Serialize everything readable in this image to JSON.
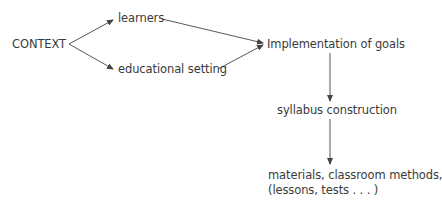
{
  "diagram": {
    "nodes": {
      "context": "CONTEXT",
      "learners": "learners",
      "educational_setting": "educational setting",
      "implementation": "Implementation of goals",
      "syllabus": "syllabus construction",
      "materials_line1": "materials, classroom methods,",
      "materials_line2": "(lessons, tests . . . )"
    },
    "edges": [
      {
        "from": "CONTEXT",
        "to": "learners"
      },
      {
        "from": "CONTEXT",
        "to": "educational setting"
      },
      {
        "from": "learners",
        "to": "Implementation of goals"
      },
      {
        "from": "educational setting",
        "to": "Implementation of goals"
      },
      {
        "from": "Implementation of goals",
        "to": "syllabus construction"
      },
      {
        "from": "syllabus construction",
        "to": "materials, classroom methods, (lessons, tests . . . )"
      }
    ],
    "colors": {
      "text": "#3a3a3a",
      "line": "#444444",
      "background": "#ffffff"
    }
  }
}
